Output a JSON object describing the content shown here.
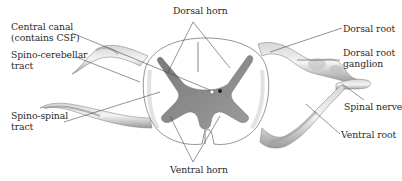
{
  "diagram": {
    "labels": {
      "dorsal_horn": "Dorsal horn",
      "central_canal_line1": "Central canal",
      "central_canal_line2": "(contains CSF)",
      "spino_cerebellar_line1": "Spino-cerebellar",
      "spino_cerebellar_line2": "tract",
      "spino_spinal_line1": "Spino-spinal",
      "spino_spinal_line2": "tract",
      "ventral_horn": "Ventral horn",
      "dorsal_root": "Dorsal root",
      "dorsal_root_ganglion_line1": "Dorsal root",
      "dorsal_root_ganglion_line2": "ganglion",
      "spinal_nerve": "Spinal nerve",
      "ventral_root": "Ventral root"
    },
    "colors": {
      "gray_matter": "#8a8a8a",
      "white_matter": "#ffffff",
      "outline": "#6a6a6a",
      "shading": "#b5b5b5",
      "leader_line": "#3a3a3a",
      "text": "#2a2a2a"
    }
  }
}
